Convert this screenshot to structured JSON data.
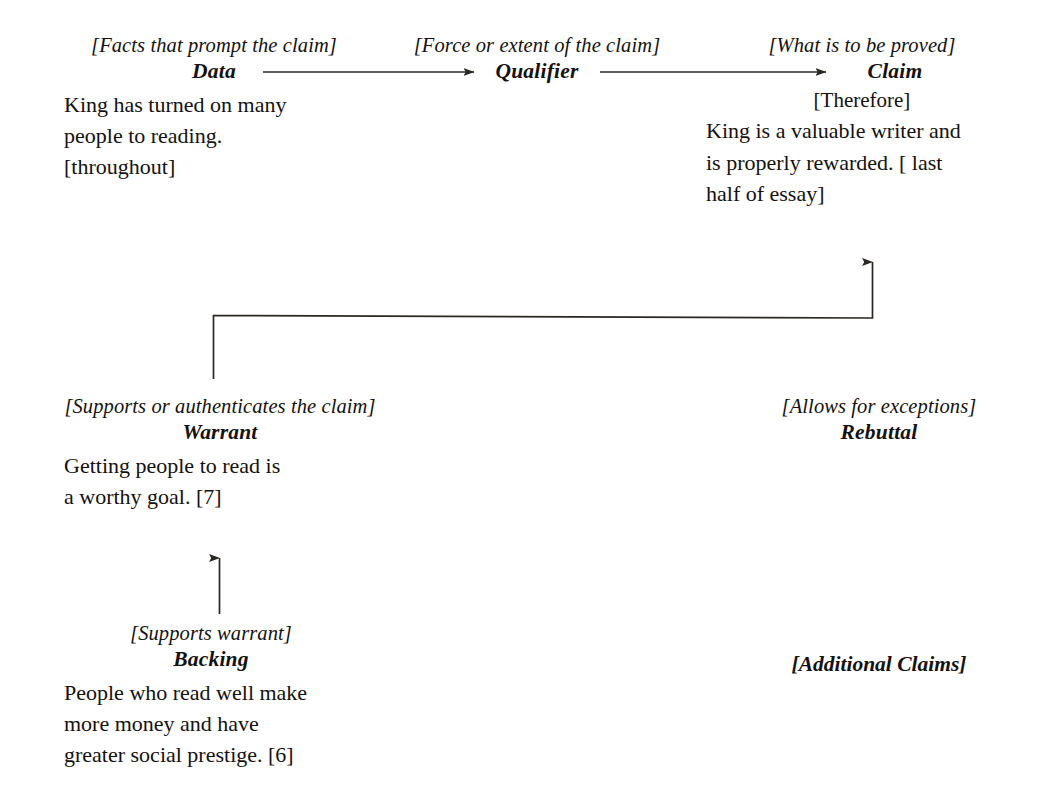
{
  "diagram": {
    "line_color": "#2b2723",
    "text_color": "#14110f",
    "background": "#ffffff"
  },
  "nodes": {
    "data": {
      "function_label": "[Facts that prompt the claim]",
      "role": "Data",
      "body": "King has turned on many\npeople to reading.\n[throughout]"
    },
    "qualifier": {
      "function_label": "[Force or extent of the claim]",
      "role": "Qualifier"
    },
    "claim": {
      "function_label": "[What is to be proved]",
      "role": "Claim",
      "connective": "[Therefore]",
      "body": "King is a valuable writer and\nis properly rewarded. [ last\nhalf of essay]"
    },
    "warrant": {
      "function_label": "[Supports or authenticates the claim]",
      "role": "Warrant",
      "body": "Getting people to read is\na worthy goal. [7]"
    },
    "backing": {
      "function_label": "[Supports warrant]",
      "role": "Backing",
      "body": "People who read well make\nmore money and have\ngreater social prestige. [6]"
    },
    "rebuttal": {
      "function_label": "[Allows for exceptions]",
      "role": "Rebuttal"
    },
    "additional_claims": {
      "label": "[Additional Claims]"
    }
  },
  "connectors": [
    {
      "name": "data-to-qualifier",
      "kind": "arrow-right"
    },
    {
      "name": "qualifier-to-claim",
      "kind": "arrow-right"
    },
    {
      "name": "warrant-to-claim",
      "kind": "elbow-arrow-up"
    },
    {
      "name": "backing-to-warrant",
      "kind": "arrow-up"
    }
  ]
}
